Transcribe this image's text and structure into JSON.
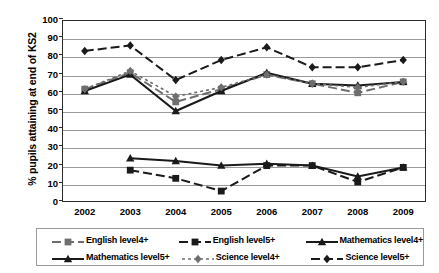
{
  "chart_data": {
    "type": "line",
    "title": "",
    "xlabel": "",
    "ylabel": "% pupils attaining at end of KS2",
    "categories": [
      "2002",
      "2003",
      "2004",
      "2005",
      "2006",
      "2007",
      "2008",
      "2009"
    ],
    "ylim": [
      0,
      100
    ],
    "ytick_labels": [
      "100",
      "90",
      "80",
      "70",
      "60",
      "50",
      "40",
      "30",
      "20",
      "10",
      "0"
    ],
    "yticks": [
      100,
      90,
      80,
      70,
      60,
      50,
      40,
      30,
      20,
      10,
      0
    ],
    "grid": true,
    "legend_position": "bottom",
    "series": [
      {
        "name": "English level4+",
        "marker": "square",
        "line_style": "dashed",
        "color": "#6e6e6e",
        "values": [
          62,
          71,
          55,
          62,
          70,
          65,
          60,
          66
        ]
      },
      {
        "name": "English level5+",
        "marker": "square",
        "line_style": "dashed",
        "color": "#1a1a1a",
        "values": [
          null,
          17.5,
          13,
          6,
          20,
          20,
          11,
          19
        ]
      },
      {
        "name": "Mathematics level4+",
        "marker": "triangle",
        "line_style": "solid",
        "color": "#1a1a1a",
        "values": [
          61,
          70,
          50,
          61,
          71,
          65,
          64,
          66
        ]
      },
      {
        "name": "Mathematics level5+",
        "marker": "triangle",
        "line_style": "solid",
        "color": "#1a1a1a",
        "values": [
          null,
          24,
          22.5,
          20,
          21,
          20,
          14,
          19
        ]
      },
      {
        "name": "Science level4+",
        "marker": "diamond",
        "line_style": "dotted",
        "color": "#6e6e6e",
        "values": [
          62,
          72,
          58,
          63,
          70,
          65,
          63,
          66
        ]
      },
      {
        "name": "Science level5+",
        "marker": "diamond",
        "line_style": "dashed",
        "color": "#1a1a1a",
        "values": [
          83,
          86,
          67,
          78,
          85,
          74,
          74,
          78
        ]
      }
    ],
    "secondary_series_note": "",
    "legend_entries": [
      "English level4+",
      "English level5+",
      "Mathematics level4+",
      "Mathematics level5+",
      "Science level4+",
      "Science level5+"
    ]
  },
  "colors": {
    "grid": "#9a9a9a",
    "axis": "#2b2b2b",
    "dark": "#1a1a1a",
    "grey": "#6e6e6e",
    "background": "#ffffff"
  }
}
